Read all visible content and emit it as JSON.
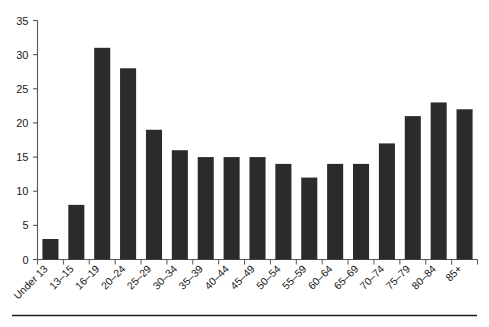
{
  "chart_data": {
    "type": "bar",
    "title": "",
    "subtitle": "",
    "xlabel": "",
    "ylabel": "",
    "categories": [
      "Under 13",
      "13–15",
      "16–19",
      "20–24",
      "25–29",
      "30–34",
      "35–39",
      "40–44",
      "45–49",
      "50–54",
      "55–59",
      "60–64",
      "65–69",
      "70–74",
      "75–79",
      "80–84",
      "85+"
    ],
    "values": [
      3,
      8,
      31,
      28,
      19,
      16,
      15,
      15,
      15,
      14,
      12,
      14,
      14,
      17,
      21,
      23,
      22
    ],
    "ylim": [
      0,
      35
    ],
    "xlim": [
      0,
      17
    ],
    "yticks": [
      0,
      5,
      10,
      15,
      20,
      25,
      30,
      35
    ],
    "ytick_labels": [
      "0",
      "5",
      "10",
      "15",
      "20",
      "25",
      "30",
      "35"
    ],
    "grid": false,
    "legend": false,
    "legend_position": "none",
    "bar_color": "#2b2b2b",
    "axis_color": "#55555a",
    "background_color": "#ffffff",
    "xtick_label_rotation": 45
  },
  "figure": {
    "footer_rule": true,
    "footer_rule_color": "#1c1c1c"
  }
}
